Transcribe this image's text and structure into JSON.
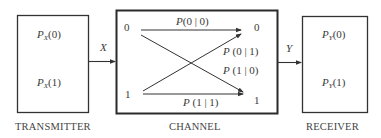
{
  "transmitter": {
    "caption": "TRANSMITTER",
    "p0": {
      "sym": "P",
      "sub": "X",
      "arg": "(0)"
    },
    "p1": {
      "sym": "P",
      "sub": "X",
      "arg": "(1)"
    }
  },
  "signals": {
    "input": "X",
    "output": "Y"
  },
  "channel": {
    "caption": "CHANNEL",
    "inputs": [
      "0",
      "1"
    ],
    "outputs": [
      "0",
      "1"
    ],
    "transitions": {
      "p00": {
        "sym": "P",
        "arg": "(0 | 0)"
      },
      "p01": {
        "sym": "P",
        "arg": " (0 | 1)"
      },
      "p10": {
        "sym": "P",
        "arg": " (1 | 0)"
      },
      "p11": {
        "sym": "P",
        "arg": " (1 | 1)"
      }
    }
  },
  "receiver": {
    "caption": "RECEIVER",
    "p0": {
      "sym": "P",
      "sub": "Y",
      "arg": "(0)"
    },
    "p1": {
      "sym": "P",
      "sub": "Y",
      "arg": "(1)"
    }
  },
  "colors": {
    "line": "#333333",
    "text": "#3a3a3a"
  }
}
